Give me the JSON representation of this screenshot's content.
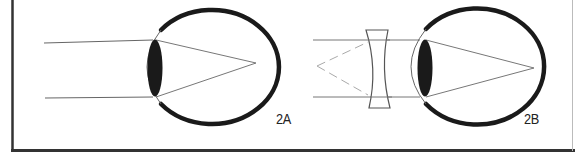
{
  "figure": {
    "panels": [
      {
        "id": "2A",
        "label": "2A",
        "description": "Myopic eye: parallel light rays enter the eye and focus in front of the retina",
        "has_corrective_lens": false
      },
      {
        "id": "2B",
        "label": "2B",
        "description": "Myopic eye corrected with a concave (diverging) lens: rays diverge from a virtual focal point and focus on the retina",
        "has_corrective_lens": true,
        "corrective_lens_type": "concave"
      }
    ],
    "colors": {
      "line": "#555555",
      "outline": "#1a1a1a",
      "dashed": "#aaaaaa",
      "border": "#333333",
      "background": "#ffffff"
    }
  }
}
